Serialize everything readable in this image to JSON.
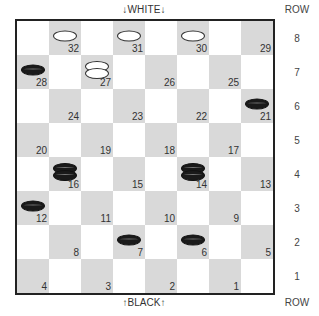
{
  "labels": {
    "top": "↓WHITE↓",
    "bottom": "↑BLACK↑",
    "row_header": "ROW",
    "rows": [
      "8",
      "7",
      "6",
      "5",
      "4",
      "3",
      "2",
      "1"
    ]
  },
  "colors": {
    "dark_square": "#d9d9d9",
    "light_square": "#ffffff",
    "black_piece": "#1a1a1a",
    "white_piece": "#ffffff"
  },
  "board": {
    "squares": [
      {
        "num": "32",
        "row": 0,
        "col": 1,
        "piece": "white",
        "count": 1
      },
      {
        "num": "31",
        "row": 0,
        "col": 3,
        "piece": "white",
        "count": 1
      },
      {
        "num": "30",
        "row": 0,
        "col": 5,
        "piece": "white",
        "count": 1
      },
      {
        "num": "29",
        "row": 0,
        "col": 7,
        "piece": null,
        "count": 0
      },
      {
        "num": "28",
        "row": 1,
        "col": 0,
        "piece": "black",
        "count": 1
      },
      {
        "num": "27",
        "row": 1,
        "col": 2,
        "piece": "white",
        "count": 2
      },
      {
        "num": "26",
        "row": 1,
        "col": 4,
        "piece": null,
        "count": 0
      },
      {
        "num": "25",
        "row": 1,
        "col": 6,
        "piece": null,
        "count": 0
      },
      {
        "num": "24",
        "row": 2,
        "col": 1,
        "piece": null,
        "count": 0
      },
      {
        "num": "23",
        "row": 2,
        "col": 3,
        "piece": null,
        "count": 0
      },
      {
        "num": "22",
        "row": 2,
        "col": 5,
        "piece": null,
        "count": 0
      },
      {
        "num": "21",
        "row": 2,
        "col": 7,
        "piece": "black",
        "count": 1
      },
      {
        "num": "20",
        "row": 3,
        "col": 0,
        "piece": null,
        "count": 0
      },
      {
        "num": "19",
        "row": 3,
        "col": 2,
        "piece": null,
        "count": 0
      },
      {
        "num": "18",
        "row": 3,
        "col": 4,
        "piece": null,
        "count": 0
      },
      {
        "num": "17",
        "row": 3,
        "col": 6,
        "piece": null,
        "count": 0
      },
      {
        "num": "16",
        "row": 4,
        "col": 1,
        "piece": "black",
        "count": 2
      },
      {
        "num": "15",
        "row": 4,
        "col": 3,
        "piece": null,
        "count": 0
      },
      {
        "num": "14",
        "row": 4,
        "col": 5,
        "piece": "black",
        "count": 2
      },
      {
        "num": "13",
        "row": 4,
        "col": 7,
        "piece": null,
        "count": 0
      },
      {
        "num": "12",
        "row": 5,
        "col": 0,
        "piece": "black",
        "count": 1
      },
      {
        "num": "11",
        "row": 5,
        "col": 2,
        "piece": null,
        "count": 0
      },
      {
        "num": "10",
        "row": 5,
        "col": 4,
        "piece": null,
        "count": 0
      },
      {
        "num": "9",
        "row": 5,
        "col": 6,
        "piece": null,
        "count": 0
      },
      {
        "num": "8",
        "row": 6,
        "col": 1,
        "piece": null,
        "count": 0
      },
      {
        "num": "7",
        "row": 6,
        "col": 3,
        "piece": "black",
        "count": 1
      },
      {
        "num": "6",
        "row": 6,
        "col": 5,
        "piece": "black",
        "count": 1
      },
      {
        "num": "5",
        "row": 6,
        "col": 7,
        "piece": null,
        "count": 0
      },
      {
        "num": "4",
        "row": 7,
        "col": 0,
        "piece": null,
        "count": 0
      },
      {
        "num": "3",
        "row": 7,
        "col": 2,
        "piece": null,
        "count": 0
      },
      {
        "num": "2",
        "row": 7,
        "col": 4,
        "piece": null,
        "count": 0
      },
      {
        "num": "1",
        "row": 7,
        "col": 6,
        "piece": null,
        "count": 0
      }
    ]
  }
}
